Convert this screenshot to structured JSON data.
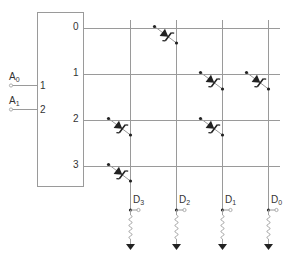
{
  "diagram": {
    "colors": {
      "line": "#9a9a9a",
      "ink": "#222222",
      "text": "#333333"
    },
    "decoder": {
      "box": {
        "x": 37,
        "y": 12,
        "w": 46,
        "h": 174
      },
      "inputs": [
        {
          "name": "A",
          "sub": "0",
          "pin": "1",
          "y": 85
        },
        {
          "name": "A",
          "sub": "1",
          "pin": "2",
          "y": 109
        }
      ],
      "outputs": [
        {
          "label": "0",
          "y": 28
        },
        {
          "label": "1",
          "y": 74
        },
        {
          "label": "2",
          "y": 120
        },
        {
          "label": "3",
          "y": 166
        }
      ]
    },
    "columns": [
      {
        "name": "D",
        "sub": "3",
        "x": 130
      },
      {
        "name": "D",
        "sub": "2",
        "x": 176
      },
      {
        "name": "D",
        "sub": "1",
        "x": 222
      },
      {
        "name": "D",
        "sub": "0",
        "x": 268
      }
    ],
    "diodes": [
      {
        "row": 0,
        "col": 1
      },
      {
        "row": 1,
        "col": 2
      },
      {
        "row": 1,
        "col": 3
      },
      {
        "row": 2,
        "col": 0
      },
      {
        "row": 2,
        "col": 2
      },
      {
        "row": 3,
        "col": 0
      }
    ],
    "row_line_end_x": 280,
    "column_top_y": 20,
    "output_tap_y": 210
  }
}
